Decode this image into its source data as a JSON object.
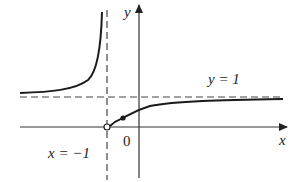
{
  "figure": {
    "type": "function-graph"
  },
  "axes": {
    "x_label": "x",
    "y_label": "y",
    "origin_label": "0"
  },
  "asymptotes": {
    "vertical": {
      "label": "x = −1",
      "value": -1
    },
    "horizontal": {
      "label": "y = 1",
      "value": 1
    }
  },
  "points": {
    "open_circle": {
      "description": "open circle at (-1, 0)",
      "x": -1,
      "y": 0
    },
    "filled_dot": {
      "description": "filled point on right branch"
    }
  },
  "colors": {
    "curve": "#1a1a1a",
    "axes": "#333333",
    "dashed": "#444444",
    "background": "#ffffff"
  }
}
